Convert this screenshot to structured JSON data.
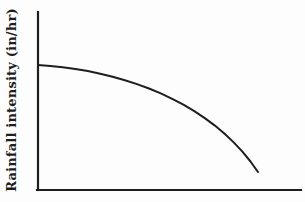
{
  "colors": {
    "ink": "#1e1e1e",
    "paper": "#fdfdfd"
  },
  "chart_data": {
    "type": "line",
    "title": "",
    "xlabel": "",
    "ylabel": "Rainfall intensity (in/hr)",
    "grid": false,
    "legend": "none",
    "x_axis": {
      "ticks": [],
      "tick_labels": []
    },
    "y_axis": {
      "ticks": [],
      "tick_labels": []
    },
    "series": [
      {
        "name": "rainfall-intensity-curve",
        "shape": "concave-down decreasing curve, starts horizontal at y-axis and steepens to the right, ending above the x-axis",
        "points_px": [
          [
            38,
            65
          ],
          [
            50.4,
            65.9
          ],
          [
            62.8,
            67.3
          ],
          [
            75.3,
            69.0
          ],
          [
            87.8,
            71.1
          ],
          [
            100.2,
            73.7
          ],
          [
            112.6,
            76.7
          ],
          [
            124.9,
            80.2
          ],
          [
            137.0,
            84.1
          ],
          [
            149.0,
            88.5
          ],
          [
            160.8,
            93.4
          ],
          [
            172.2,
            98.8
          ],
          [
            183.4,
            104.7
          ],
          [
            194.3,
            111.1
          ],
          [
            204.8,
            118.1
          ],
          [
            214.9,
            125.6
          ],
          [
            224.6,
            133.7
          ],
          [
            233.7,
            142.4
          ],
          [
            242.4,
            151.6
          ],
          [
            250.5,
            161.5
          ],
          [
            258,
            172
          ]
        ]
      }
    ]
  }
}
